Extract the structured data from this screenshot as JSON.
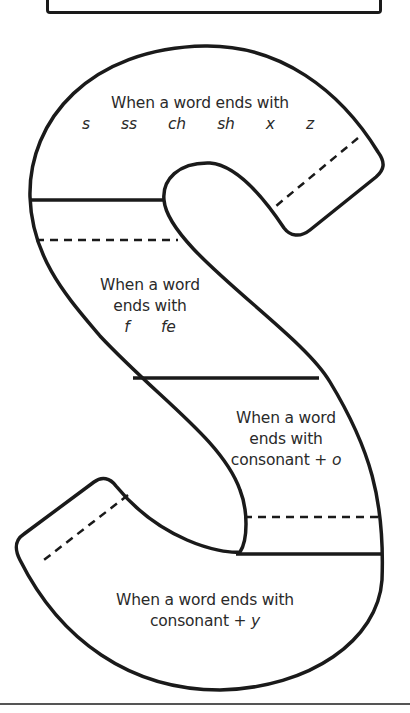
{
  "worksheet": {
    "shape": "letter-S",
    "sections": [
      {
        "id": "s-ss-ch-sh-x-z",
        "line1": "When a word ends with",
        "endings": [
          "s",
          "ss",
          "ch",
          "sh",
          "x",
          "z"
        ]
      },
      {
        "id": "f-fe",
        "line1": "When a word",
        "line2": "ends with",
        "endings": [
          "f",
          "fe"
        ]
      },
      {
        "id": "consonant-o",
        "line1": "When a word",
        "line2": "ends with",
        "line3_prefix": "consonant +",
        "line3_italic": "o"
      },
      {
        "id": "consonant-y",
        "line1": "When a word ends with",
        "line2_prefix": "consonant +",
        "line2_italic": "y"
      }
    ],
    "colors": {
      "ink": "#1a1a1a",
      "background": "#ffffff",
      "rule": "#555555"
    }
  }
}
